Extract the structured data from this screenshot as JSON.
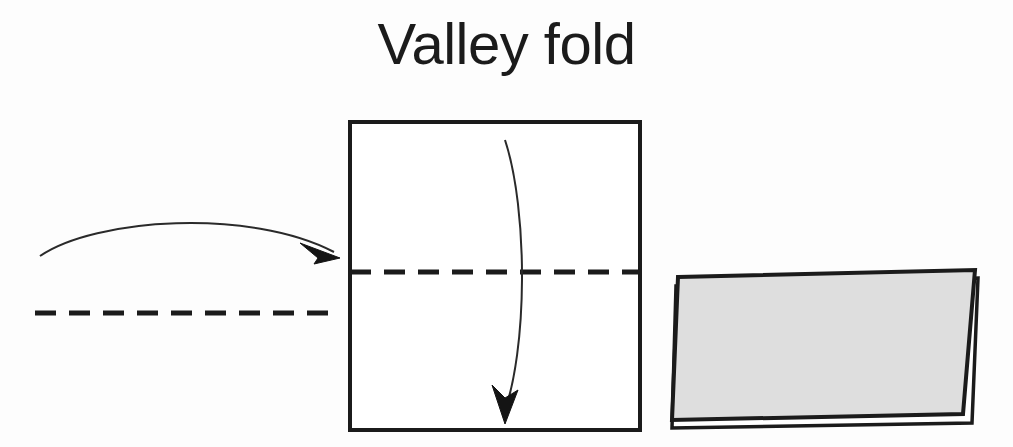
{
  "page": {
    "title": "Valley fold",
    "background_color": "#fdfdfd",
    "ink_color": "#1b1b1b",
    "paper_fill": "#dedede",
    "paper_white": "#ffffff"
  },
  "diagram": {
    "type": "origami-instruction",
    "caption": "Valley fold",
    "panels": [
      {
        "name": "crease-legend",
        "description": "Horizontal dashed valley-fold crease line with a curved arrow arcing to the right",
        "dashed_line": {
          "x1": 35,
          "y1": 313,
          "x2": 333,
          "y2": 313,
          "dash": 20,
          "gap": 13,
          "width": 5
        },
        "arrow": {
          "start_x": 40,
          "start_y": 256,
          "peak_x": 175,
          "peak_y": 222,
          "end_x": 336,
          "end_y": 256,
          "direction": "right"
        }
      },
      {
        "name": "square-sheet",
        "description": "Square sheet of paper with a horizontal dashed crease across the middle and a curved arrow folding the top half down",
        "square": {
          "x": 350,
          "y": 122,
          "width": 290,
          "height": 308,
          "stroke": 4
        },
        "dashed_line": {
          "x1": 350,
          "y1": 272,
          "x2": 640,
          "y2": 272,
          "dash": 20,
          "gap": 13,
          "width": 5
        },
        "arrow": {
          "start_x": 505,
          "start_y": 140,
          "bow_x": 524,
          "bow_y": 285,
          "end_x": 504,
          "end_y": 424,
          "direction": "down"
        }
      },
      {
        "name": "folded-result",
        "description": "Resulting folded paper shown in perspective: a shaded top flap over a white lower layer",
        "top_flap": {
          "fill": "#dedede",
          "stroke": "#1b1b1b",
          "points": "678,277 975,270 963,414 672,420"
        },
        "under_layer": {
          "fill": "#ffffff",
          "stroke": "#1b1b1b",
          "points": "676,286 978,278 972,423 672,428"
        }
      }
    ]
  }
}
